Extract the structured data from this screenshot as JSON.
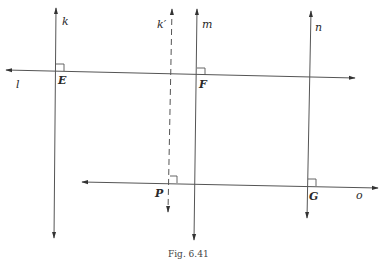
{
  "figure": {
    "caption": "Fig. 6.41",
    "line_color": "#555555",
    "lines": {
      "k": "k",
      "k_prime": "k′",
      "m": "m",
      "n": "n",
      "l": "l",
      "o": "o"
    },
    "points": {
      "E": "E",
      "F": "F",
      "P": "P",
      "G": "G"
    }
  }
}
